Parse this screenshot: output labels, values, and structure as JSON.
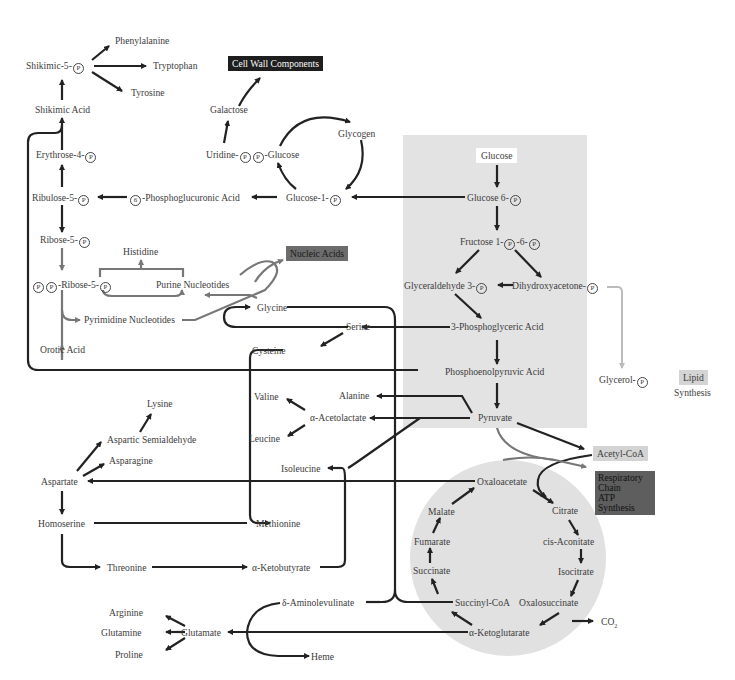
{
  "regions": {
    "glycolysis_color": "#e3e3e3",
    "tca_cycle_color": "#e1e1e1"
  },
  "boxes": {
    "cell_wall": "Cell Wall Components",
    "nucleic_acids": "Nucleic Acids",
    "glucose": "Glucose",
    "acetyl_coa": "Acetyl-CoA",
    "respiratory": [
      "Respiratory",
      "Chain",
      "ATP",
      "Synthesis"
    ],
    "lipid": "Lipid",
    "lipid_synthesis": "Synthesis"
  },
  "phosphate_symbol": "P",
  "six_symbol": "6",
  "nodes": {
    "phenylalanine": "Phenylalanine",
    "shikimic_5p": "Shikimic-5-",
    "tryptophan": "Tryptophan",
    "tyrosine": "Tyrosine",
    "shikimic_acid": "Shikimic Acid",
    "galactose": "Galactose",
    "glycogen": "Glycogen",
    "erythrose_4p": "Erythrose-4-",
    "uridine": "Uridine-",
    "udp_glucose_suffix": "-Glucose",
    "ribulose_5p": "Ribulose-5-",
    "phosphoglucuronic": "-Phosphoglucuronic Acid",
    "glucose_1p": "Glucose-1-",
    "glucose_6p": "Glucose 6-",
    "ribose_5p": "Ribose-5-",
    "histidine": "Histidine",
    "fructose_prefix": "Fructose 1-",
    "fructose_mid": "-6-",
    "prpp_suffix": "-Ribose-5-",
    "purine": "Purine Nucleotides",
    "glyceraldehyde": "Glyceraldehyde 3-",
    "dihydroxyacetone": "Dihydroxyacetone-",
    "glycine": "Glycine",
    "pyrimidine": "Pyrimidine Nucleotides",
    "serine": "Serine",
    "phosphoglyceric": "3-Phosphoglyceric Acid",
    "orotic": "Orotic Acid",
    "cysteine": "Cysteine",
    "pep": "Phosphoenolpyruvic Acid",
    "glycerol": "Glycerol-",
    "lysine": "Lysine",
    "valine": "Valine",
    "alanine": "Alanine",
    "acetolactate": "α-Acetolactate",
    "aspartic_semialdehyde": "Aspartic Semialdehyde",
    "leucine": "Leucine",
    "pyruvate": "Pyruvate",
    "asparagine": "Asparagine",
    "isoleucine": "Isoleucine",
    "aspartate": "Aspartate",
    "oxaloacetate": "Oxaloacetate",
    "malate": "Malate",
    "citrate": "Citrate",
    "homoserine": "Homoserine",
    "methionine": "Methionine",
    "fumarate": "Fumarate",
    "cis_aconitate": "cis-Aconitate",
    "succinate": "Succinate",
    "isocitrate": "Isocitrate",
    "threonine": "Threonine",
    "ketobutyrate": "α-Ketobutyrate",
    "aminolevulinate": "δ-Aminolevulinate",
    "succinyl_coa": "Succinyl-CoA",
    "oxalosuccinate": "Oxalosuccinate",
    "co2": "CO",
    "co2_sub": "2",
    "arginine": "Arginine",
    "glutamine": "Glutamine",
    "glutamate": "Glutamate",
    "ketoglutarate": "α-Ketoglutarate",
    "proline": "Proline",
    "heme": "Heme"
  }
}
